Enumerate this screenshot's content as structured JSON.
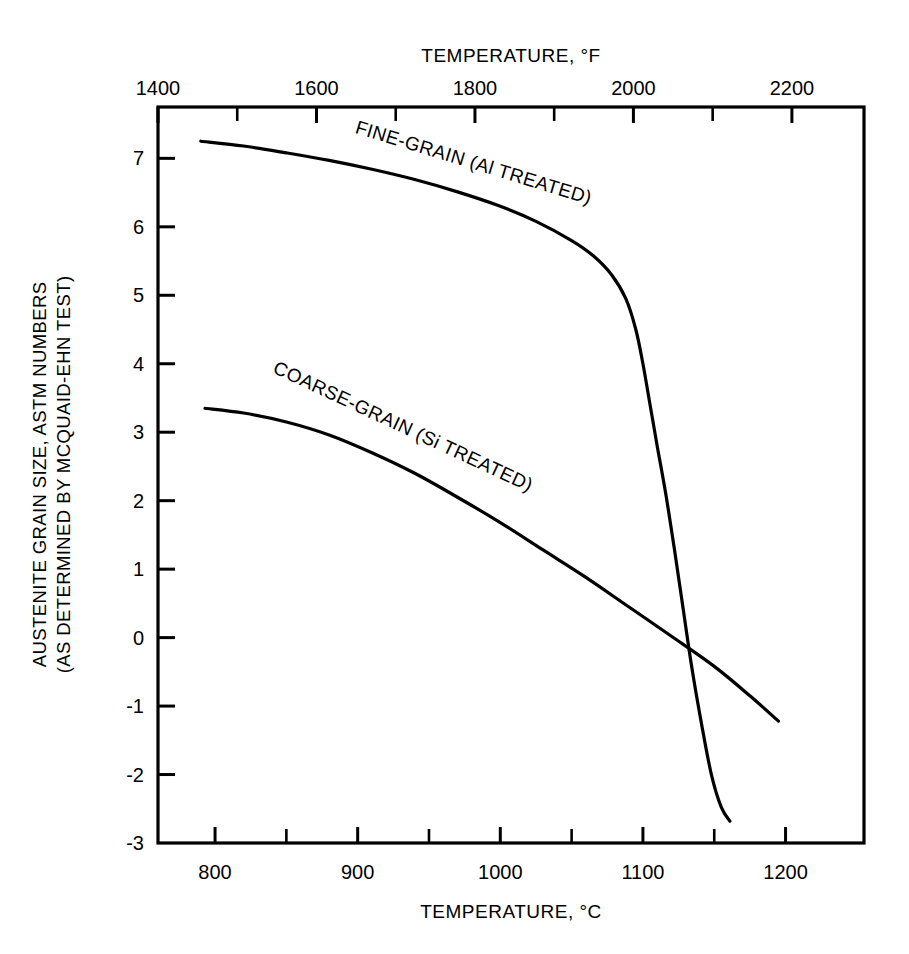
{
  "chart_data": {
    "type": "line",
    "title": "",
    "xlabel": "TEMPERATURE, °C",
    "xlabel_top": "TEMPERATURE, °F",
    "ylabel_line1": "AUSTENITE GRAIN SIZE, ASTM NUMBERS",
    "ylabel_line2": "(AS DETERMINED BY MCQUAID-EHN TEST)",
    "xlim": [
      760,
      1255
    ],
    "ylim": [
      -3,
      7.75
    ],
    "xlim_top_f": [
      1400,
      2291
    ],
    "grid": false,
    "legend": "inline-curve-labels",
    "x_ticks_major": [
      800,
      900,
      1000,
      1100,
      1200
    ],
    "x_ticks_minor": [
      850,
      950,
      1050,
      1150
    ],
    "x_tick_labels": [
      "800",
      "900",
      "1000",
      "1100",
      "1200"
    ],
    "x_ticks_top_major": [
      1400,
      1600,
      1800,
      2000,
      2200
    ],
    "x_ticks_top_minor": [
      1500,
      1700,
      1900,
      2100
    ],
    "x_tick_labels_top": [
      "1400",
      "1600",
      "1800",
      "2000",
      "2200"
    ],
    "y_ticks": [
      7,
      6,
      5,
      4,
      3,
      2,
      1,
      0,
      -1,
      -2,
      -3
    ],
    "y_tick_labels": [
      "7",
      "6",
      "5",
      "4",
      "3",
      "2",
      "1",
      "0",
      "-1",
      "-2",
      "-3"
    ],
    "series": [
      {
        "name": "FINE-GRAIN  (Al TREATED)",
        "label": "FINE-GRAIN",
        "label_suffix": "(Al TREATED)",
        "color": "#000000",
        "points": [
          [
            790,
            7.25
          ],
          [
            820,
            7.18
          ],
          [
            850,
            7.08
          ],
          [
            880,
            6.97
          ],
          [
            910,
            6.84
          ],
          [
            940,
            6.69
          ],
          [
            970,
            6.51
          ],
          [
            1000,
            6.3
          ],
          [
            1025,
            6.08
          ],
          [
            1050,
            5.8
          ],
          [
            1065,
            5.58
          ],
          [
            1078,
            5.3
          ],
          [
            1088,
            4.95
          ],
          [
            1095,
            4.5
          ],
          [
            1100,
            4.0
          ],
          [
            1105,
            3.4
          ],
          [
            1110,
            2.8
          ],
          [
            1116,
            2.1
          ],
          [
            1122,
            1.3
          ],
          [
            1128,
            0.45
          ],
          [
            1134,
            -0.4
          ],
          [
            1141,
            -1.25
          ],
          [
            1148,
            -2.0
          ],
          [
            1155,
            -2.48
          ],
          [
            1161,
            -2.68
          ]
        ]
      },
      {
        "name": "COARSE-GRAIN  (Si TREATED)",
        "label": "COARSE-GRAIN",
        "label_suffix": "(Si TREATED)",
        "color": "#000000",
        "points": [
          [
            793,
            3.35
          ],
          [
            820,
            3.28
          ],
          [
            850,
            3.15
          ],
          [
            880,
            2.96
          ],
          [
            910,
            2.7
          ],
          [
            940,
            2.4
          ],
          [
            970,
            2.05
          ],
          [
            1000,
            1.68
          ],
          [
            1030,
            1.28
          ],
          [
            1060,
            0.88
          ],
          [
            1090,
            0.45
          ],
          [
            1120,
            0.02
          ],
          [
            1150,
            -0.42
          ],
          [
            1175,
            -0.85
          ],
          [
            1195,
            -1.22
          ]
        ]
      }
    ],
    "annotations": [
      {
        "text": "FINE-GRAIN  (Al TREATED)",
        "x": 980,
        "y": 6.85,
        "rotation": 17
      },
      {
        "text": "COARSE-GRAIN  (Si TREATED)",
        "x": 930,
        "y": 3.0,
        "rotation": 25
      }
    ],
    "crossover": {
      "x": 1127,
      "y": -0.25
    }
  },
  "figure": {
    "background": "#ffffff",
    "line_color": "#000000",
    "frame_color": "#000000"
  }
}
